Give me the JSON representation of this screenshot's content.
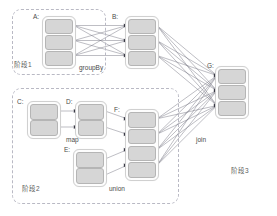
{
  "diagram": {
    "type": "dag",
    "stages": [
      {
        "id": "stage1",
        "label": "阶段1",
        "label_x": 14,
        "label_y": 59,
        "x": 12,
        "y": 9,
        "w": 92,
        "h": 64
      },
      {
        "id": "stage2",
        "label": "阶段2",
        "label_x": 22,
        "label_y": 183,
        "x": 12,
        "y": 88,
        "w": 165,
        "h": 114
      },
      {
        "id": "stage3",
        "label": "阶段3",
        "label_x": 231,
        "label_y": 165,
        "x": 0,
        "y": 0,
        "w": 0,
        "h": 0
      }
    ],
    "nodes": [
      {
        "id": "A",
        "label": "A:",
        "label_x": 33,
        "label_y": 13,
        "x": 42,
        "y": 16,
        "w": 34,
        "h": 53,
        "partitions": 3,
        "stage": "stage1"
      },
      {
        "id": "B",
        "label": "B:",
        "label_x": 112,
        "label_y": 13,
        "x": 125,
        "y": 16,
        "w": 34,
        "h": 53,
        "partitions": 3,
        "stage": "stage1"
      },
      {
        "id": "C",
        "label": "C:",
        "label_x": 17,
        "label_y": 98,
        "x": 27,
        "y": 101,
        "w": 34,
        "h": 38,
        "partitions": 2,
        "stage": "stage2"
      },
      {
        "id": "D",
        "label": "D:",
        "label_x": 66,
        "label_y": 98,
        "x": 75,
        "y": 101,
        "w": 32,
        "h": 38,
        "partitions": 2,
        "stage": "stage2"
      },
      {
        "id": "E",
        "label": "E:",
        "label_x": 64,
        "label_y": 146,
        "x": 73,
        "y": 149,
        "w": 34,
        "h": 38,
        "partitions": 2,
        "stage": "stage2"
      },
      {
        "id": "F",
        "label": "F:",
        "label_x": 114,
        "label_y": 106,
        "x": 125,
        "y": 109,
        "w": 34,
        "h": 72,
        "partitions": 4,
        "stage": "stage2"
      },
      {
        "id": "G",
        "label": "G:",
        "label_x": 207,
        "label_y": 62,
        "x": 215,
        "y": 66,
        "w": 34,
        "h": 53,
        "partitions": 3,
        "stage": "stage3"
      }
    ],
    "operations": [
      {
        "id": "groupBy",
        "label": "groupBy",
        "x": 79,
        "y": 64,
        "from": "A",
        "to": "B"
      },
      {
        "id": "map",
        "label": "map",
        "x": 66,
        "y": 136,
        "from": "C",
        "to": "D"
      },
      {
        "id": "union",
        "label": "union",
        "x": 109,
        "y": 185,
        "from": "E",
        "to": "F"
      },
      {
        "id": "join",
        "label": "join",
        "x": 196,
        "y": 136,
        "from": "F",
        "to": "G"
      }
    ],
    "colors": {
      "partition_fill": "#d6d6d6",
      "partition_border": "#b5b5b5",
      "rdd_border": "#d0d0d0",
      "stage_border": "#b9b9c4",
      "edge": "#6d6d7a",
      "text": "#4a4a4a",
      "background": "#ffffff"
    }
  }
}
